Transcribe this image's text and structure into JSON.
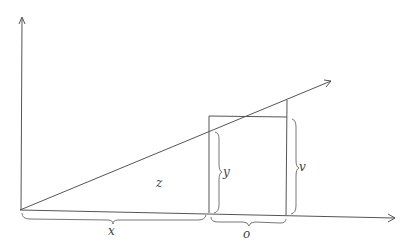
{
  "diagram": {
    "type": "geometric-figure",
    "colors": {
      "line": "#555555",
      "brace": "#777777",
      "text": "#444444"
    },
    "labels": {
      "z": "z",
      "y": "y",
      "v": "v",
      "x": "x",
      "o": "o"
    },
    "elements": {
      "vertical_axis": "arrow",
      "horizontal_axis": "arrow",
      "diagonal_ray": "arrow",
      "rectangle": "box standing on horizontal axis",
      "braces": [
        "x (horizontal, under axis from origin to rectangle)",
        "o (horizontal, under rectangle width)",
        "y (vertical, left inner side of rectangle)",
        "v (vertical, right side of rectangle up to ray)"
      ]
    }
  }
}
